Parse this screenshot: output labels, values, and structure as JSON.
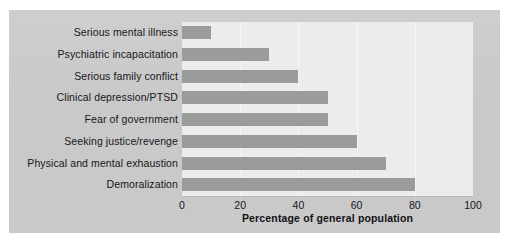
{
  "figure": {
    "panel_background": "#c9c9c9",
    "plot_background": "#ececeb",
    "bar_color": "#9a9b9b",
    "text_color": "#16161a"
  },
  "chart_data": {
    "type": "bar",
    "orientation": "horizontal",
    "title": "",
    "subtitle": "",
    "xlabel": "Percentage of general population",
    "ylabel": "",
    "xlim": [
      0,
      100
    ],
    "xticks": [
      0,
      20,
      40,
      60,
      80,
      100
    ],
    "xtick_labels": [
      "0",
      "20",
      "40",
      "60",
      "80",
      "100"
    ],
    "grid": false,
    "legend": null,
    "categories": [
      "Serious mental illness",
      "Psychiatric incapacitation",
      "Serious family conflict",
      "Clinical depression/PTSD",
      "Fear of government",
      "Seeking justice/revenge",
      "Physical and mental exhaustion",
      "Demoralization"
    ],
    "values": [
      10,
      30,
      40,
      50,
      50,
      60,
      70,
      80
    ],
    "series": [
      {
        "name": "Percentage of general population",
        "values": [
          10,
          30,
          40,
          50,
          50,
          60,
          70,
          80
        ]
      }
    ]
  }
}
